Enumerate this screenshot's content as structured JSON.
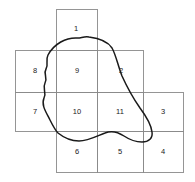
{
  "figure": {
    "title": "",
    "background_color": "#ffffff",
    "grid_line_color": "#8a8a8a",
    "curve_color": "#1a1a1a",
    "label_color": "#1a1a1a",
    "grid": {
      "column_edges": [
        15,
        56,
        97,
        143,
        183
      ],
      "row_edges": [
        9,
        50,
        92,
        131,
        172
      ],
      "cell_size": 41
    },
    "cells": [
      {
        "label": "1",
        "col": 2,
        "row": 1,
        "x": 76,
        "y": 29
      },
      {
        "label": "8",
        "col": 1,
        "row": 2,
        "x": 35,
        "y": 71
      },
      {
        "label": "9",
        "col": 2,
        "row": 2,
        "x": 77,
        "y": 71
      },
      {
        "label": "2",
        "col": 3,
        "row": 2,
        "x": 121,
        "y": 71
      },
      {
        "label": "7",
        "col": 1,
        "row": 3,
        "x": 35,
        "y": 112
      },
      {
        "label": "10",
        "col": 2,
        "row": 3,
        "x": 77,
        "y": 112
      },
      {
        "label": "11",
        "col": 3,
        "row": 3,
        "x": 120,
        "y": 112
      },
      {
        "label": "3",
        "col": 4,
        "row": 3,
        "x": 163,
        "y": 112
      },
      {
        "label": "6",
        "col": 2,
        "row": 4,
        "x": 77,
        "y": 152
      },
      {
        "label": "5",
        "col": 3,
        "row": 4,
        "x": 120,
        "y": 152
      },
      {
        "label": "4",
        "col": 4,
        "row": 4,
        "x": 163,
        "y": 152
      }
    ],
    "rectangles": [
      {
        "name": "cell-1-rect",
        "x": 56,
        "y": 9,
        "w": 41,
        "h": 41
      },
      {
        "name": "cell-8-rect",
        "x": 15,
        "y": 50,
        "w": 41,
        "h": 42
      },
      {
        "name": "cell-9-rect",
        "x": 56,
        "y": 50,
        "w": 41,
        "h": 42
      },
      {
        "name": "cell-2-rect",
        "x": 97,
        "y": 50,
        "w": 46,
        "h": 42
      },
      {
        "name": "cell-7-rect",
        "x": 15,
        "y": 92,
        "w": 41,
        "h": 39
      },
      {
        "name": "cell-10-rect",
        "x": 56,
        "y": 92,
        "w": 41,
        "h": 39
      },
      {
        "name": "cell-11-rect",
        "x": 97,
        "y": 92,
        "w": 46,
        "h": 39
      },
      {
        "name": "cell-3-rect",
        "x": 143,
        "y": 92,
        "w": 40,
        "h": 39
      },
      {
        "name": "cell-6-rect",
        "x": 56,
        "y": 131,
        "w": 41,
        "h": 41
      },
      {
        "name": "cell-5-rect",
        "x": 97,
        "y": 131,
        "w": 46,
        "h": 41
      },
      {
        "name": "cell-4-rect",
        "x": 143,
        "y": 131,
        "w": 40,
        "h": 41
      }
    ],
    "curve_path": "M 78 38 C 66 37 54 44 48 55 C 45 61 49 64 46 69 C 43 74 48 77 45 83 C 42 89 47 92 44 98 C 41 105 46 112 50 120 C 53 126 55 130 58 133 C 63 137 70 141 79 141 C 88 141 97 136 105 133 C 112 130 118 132 124 136 C 130 140 136 142 142 142 C 149 142 153 138 152 132 C 151 124 146 116 140 108 C 133 98 127 87 122 76 C 118 66 116 55 112 48 C 107 40 97 38 89 37 C 85 36 81 38 78 38 Z"
  }
}
